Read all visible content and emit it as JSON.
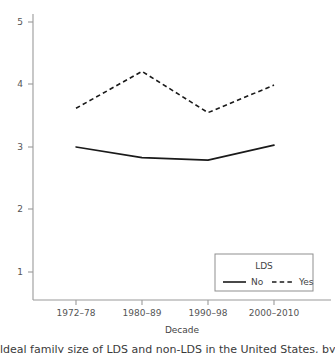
{
  "chart_data": {
    "type": "line",
    "title": "",
    "xlabel": "Decade",
    "ylabel": "",
    "categories": [
      "1972–78",
      "1980–89",
      "1990–98",
      "2000–2010"
    ],
    "series": [
      {
        "name": "No",
        "style": "solid",
        "values": [
          3.0,
          2.83,
          2.79,
          3.03
        ]
      },
      {
        "name": "Yes",
        "style": "dashed",
        "values": [
          3.62,
          4.21,
          3.55,
          3.99
        ]
      }
    ],
    "ylim": [
      0.7,
      5.3
    ],
    "yticks": [
      1,
      2,
      3,
      4,
      5
    ],
    "ytick_labels": [
      "1",
      "2",
      "3",
      "4",
      "5"
    ],
    "grid": false,
    "legend": {
      "title": "LDS",
      "position": "lower-right",
      "entries": [
        "No",
        "Yes"
      ]
    },
    "colors": {
      "line": "#1a1a1a",
      "axis": "#9a9a9a",
      "text": "#444444",
      "background": "#ffffff"
    }
  },
  "axes": {
    "x_title": "Decade",
    "y_tick_1": "1",
    "y_tick_2": "2",
    "y_tick_3": "3",
    "y_tick_4": "4",
    "y_tick_5": "5",
    "x_tick_1": "1972–78",
    "x_tick_2": "1980–89",
    "x_tick_3": "1990–98",
    "x_tick_4": "2000–2010"
  },
  "legend": {
    "title": "LDS",
    "entry_no": "No",
    "entry_yes": "Yes"
  },
  "caption": {
    "text": "ldeal family size of LDS and non-LDS in the United States, by d"
  }
}
